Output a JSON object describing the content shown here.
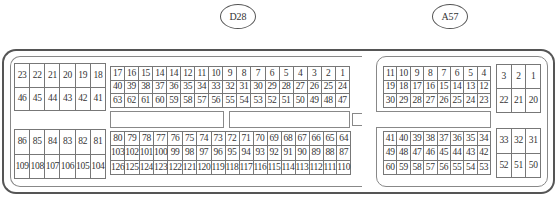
{
  "connectors": {
    "d28": {
      "label": "D28",
      "blocks": {
        "top_left": [
          [
            "23",
            "22",
            "21",
            "20",
            "19",
            "18"
          ],
          [
            "46",
            "45",
            "44",
            "43",
            "42",
            "41"
          ]
        ],
        "top_main": [
          [
            "17",
            "16",
            "15",
            "14",
            "14",
            "12",
            "11",
            "10",
            "9",
            "8",
            "7",
            "6",
            "5",
            "4",
            "3",
            "2",
            "1"
          ],
          [
            "40",
            "39",
            "38",
            "37",
            "36",
            "35",
            "34",
            "33",
            "32",
            "31",
            "30",
            "29",
            "28",
            "27",
            "26",
            "25",
            "24"
          ],
          [
            "63",
            "62",
            "61",
            "60",
            "59",
            "58",
            "57",
            "56",
            "55",
            "54",
            "53",
            "52",
            "51",
            "50",
            "49",
            "48",
            "47"
          ]
        ],
        "bottom_left": [
          [
            "86",
            "85",
            "84",
            "83",
            "82",
            "81"
          ],
          [
            "109",
            "108",
            "107",
            "106",
            "105",
            "104"
          ]
        ],
        "bottom_main": [
          [
            "80",
            "79",
            "78",
            "77",
            "76",
            "75",
            "74",
            "73",
            "72",
            "71",
            "70",
            "69",
            "68",
            "67",
            "66",
            "65",
            "64"
          ],
          [
            "103",
            "102",
            "101",
            "100",
            "99",
            "98",
            "97",
            "96",
            "95",
            "94",
            "93",
            "92",
            "91",
            "90",
            "89",
            "88",
            "87"
          ],
          [
            "126",
            "125",
            "124",
            "123",
            "122",
            "121",
            "120",
            "119",
            "118",
            "117",
            "116",
            "115",
            "114",
            "113",
            "112",
            "111",
            "110"
          ]
        ]
      }
    },
    "a57": {
      "label": "A57",
      "blocks": {
        "top_main": [
          [
            "11",
            "10",
            "9",
            "8",
            "7",
            "6",
            "5",
            "4"
          ],
          [
            "19",
            "18",
            "17",
            "16",
            "15",
            "14",
            "13",
            "12"
          ],
          [
            "30",
            "29",
            "28",
            "27",
            "26",
            "25",
            "24",
            "23"
          ]
        ],
        "top_right": [
          [
            "3",
            "2",
            "1"
          ],
          [
            "22",
            "21",
            "20"
          ]
        ],
        "bottom_main": [
          [
            "41",
            "40",
            "39",
            "38",
            "37",
            "36",
            "35",
            "34"
          ],
          [
            "49",
            "48",
            "47",
            "46",
            "45",
            "44",
            "43",
            "42"
          ],
          [
            "60",
            "59",
            "58",
            "57",
            "56",
            "55",
            "54",
            "53"
          ]
        ],
        "bottom_right": [
          [
            "33",
            "32",
            "31"
          ],
          [
            "52",
            "51",
            "50"
          ]
        ]
      }
    }
  }
}
